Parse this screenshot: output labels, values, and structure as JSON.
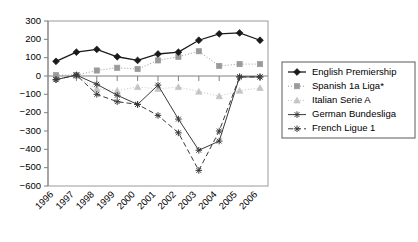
{
  "chart_data": {
    "type": "line",
    "title": "",
    "xlabel": "",
    "ylabel": "",
    "categories": [
      "1996",
      "1997",
      "1998",
      "1999",
      "2000",
      "2001",
      "2002",
      "2003",
      "2004",
      "2005",
      "2006"
    ],
    "ylim": [
      -600,
      300
    ],
    "ytick_step": 100,
    "yticks": [
      "300",
      "200",
      "100",
      "0",
      "-100",
      "-200",
      "-300",
      "-400",
      "-500",
      "-600"
    ],
    "grid": false,
    "legend_position": "right",
    "series": [
      {
        "name": "English Premiership",
        "color": "#1a1a1a",
        "marker": "diamond",
        "dash": "none",
        "values": [
          80,
          130,
          145,
          105,
          85,
          120,
          130,
          195,
          230,
          235,
          195
        ]
      },
      {
        "name": "Spanish 1a Liga*",
        "color": "#9a9a9a",
        "marker": "square",
        "dash": "dotted",
        "values": [
          5,
          5,
          30,
          45,
          38,
          85,
          105,
          135,
          55,
          65,
          65
        ]
      },
      {
        "name": "Italian Serie A",
        "color": "#c4c4c4",
        "marker": "triangle",
        "dash": "dotted",
        "values": [
          -10,
          0,
          -70,
          -80,
          -60,
          -70,
          -60,
          -85,
          -110,
          -80,
          -65
        ]
      },
      {
        "name": "German Bundesliga",
        "color": "#3a3a3a",
        "marker": "star",
        "dash": "none",
        "values": [
          -20,
          5,
          -45,
          -105,
          -155,
          -50,
          -235,
          -405,
          -355,
          -5,
          -5
        ]
      },
      {
        "name": "French Ligue 1",
        "color": "#3a3a3a",
        "marker": "star",
        "dash": "dashed",
        "values": [
          -20,
          5,
          -100,
          -140,
          -155,
          -215,
          -310,
          -515,
          -300,
          -5,
          -5
        ]
      }
    ]
  },
  "legend": {
    "items": [
      {
        "label": "English Premiership"
      },
      {
        "label": "Spanish 1a Liga*"
      },
      {
        "label": "Italian Serie A"
      },
      {
        "label": "German Bundesliga"
      },
      {
        "label": "French Ligue 1"
      }
    ]
  }
}
